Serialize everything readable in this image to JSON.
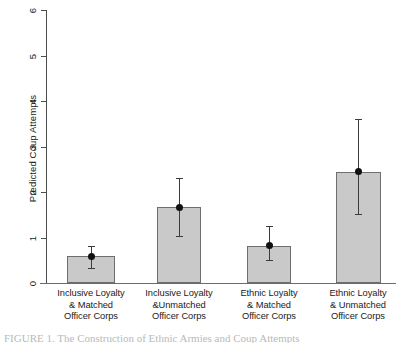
{
  "chart_data": {
    "type": "bar",
    "title": "",
    "xlabel": "",
    "ylabel": "Predicted Coup Attempts",
    "ylim": [
      0,
      6
    ],
    "yticks": [
      0,
      1,
      2,
      3,
      4,
      5,
      6
    ],
    "ytick_labels": [
      "0",
      "1",
      "2",
      "3",
      "4",
      "5",
      "6"
    ],
    "grid": false,
    "legend": null,
    "bar_fill_color": "#c9c9c9",
    "bar_edge_color": "#6e6e6e",
    "marker_color": "#111111",
    "errorbar_color": "#3b3b3b",
    "categories": [
      "Inclusive Loyalty & Matched Officer Corps",
      "Inclusive Loyalty &Unmatched Officer Corps",
      "Ethnic Loyalty & Matched Officer Corps",
      "Ethnic Loyalty & Unmatched Officer Corps"
    ],
    "category_lines": [
      [
        "Inclusive Loyalty",
        "& Matched",
        "Officer Corps"
      ],
      [
        "Inclusive Loyalty",
        "&Unmatched",
        "Officer Corps"
      ],
      [
        "Ethnic Loyalty",
        "& Matched",
        "Officer Corps"
      ],
      [
        "Ethnic Loyalty",
        "& Unmatched",
        "Officer Corps"
      ]
    ],
    "values": [
      0.59,
      1.66,
      0.82,
      2.44
    ],
    "point_estimates": [
      0.59,
      1.66,
      0.82,
      2.44
    ],
    "ci_lower": [
      0.33,
      1.03,
      0.5,
      1.52
    ],
    "ci_upper": [
      0.82,
      2.31,
      1.25,
      3.6
    ]
  },
  "caption": {
    "text": "FIGURE 1. The Construction of Ethnic Armies and Coup Attempts"
  }
}
